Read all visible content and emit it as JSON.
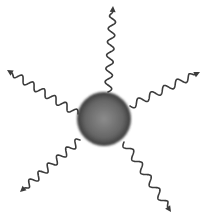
{
  "diagram": {
    "sphere": {
      "cx": 104,
      "cy": 119,
      "r": 27,
      "color_center": "#8c8c8c",
      "color_edge": "#3a3a3a"
    },
    "stroke_color": "#3c3c3c",
    "rays": [
      {
        "name": "ray-top",
        "from": [
          108,
          92
        ],
        "to": [
          113,
          6
        ],
        "waves": 6
      },
      {
        "name": "ray-upper-left",
        "from": [
          78,
          114
        ],
        "to": [
          7,
          70
        ],
        "waves": 6
      },
      {
        "name": "ray-upper-right",
        "from": [
          130,
          106
        ],
        "to": [
          200,
          72
        ],
        "waves": 5
      },
      {
        "name": "ray-lower-left",
        "from": [
          80,
          140
        ],
        "to": [
          20,
          192
        ],
        "waves": 6
      },
      {
        "name": "ray-lower-right",
        "from": [
          124,
          142
        ],
        "to": [
          171,
          212
        ],
        "waves": 5
      }
    ]
  }
}
